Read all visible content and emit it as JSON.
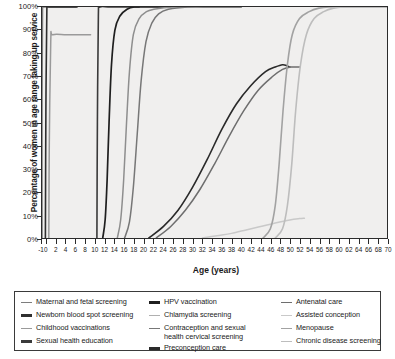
{
  "chart_data": {
    "type": "line",
    "title": "",
    "xlabel": "Age (years)",
    "ylabel": "Percentage of women in age range taking up service",
    "xlim": [
      -1,
      70
    ],
    "ylim": [
      0,
      100
    ],
    "grid": false,
    "legend_position": "below",
    "xticks": [
      -1,
      0,
      2,
      4,
      6,
      8,
      10,
      12,
      14,
      16,
      18,
      20,
      22,
      24,
      26,
      28,
      30,
      32,
      34,
      36,
      38,
      40,
      42,
      44,
      46,
      48,
      50,
      52,
      54,
      56,
      58,
      60,
      62,
      64,
      66,
      68,
      70
    ],
    "yticks": [
      0,
      10,
      20,
      30,
      40,
      50,
      60,
      70,
      80,
      90,
      100
    ],
    "ytick_labels": [
      "0%",
      "10%",
      "20%",
      "30%",
      "40%",
      "50%",
      "60%",
      "70%",
      "80%",
      "90%",
      "100%"
    ],
    "series": [
      {
        "name": "Maternal and fetal screening",
        "color": "#7d7d7d",
        "width": 1.6,
        "points": [
          [
            -1,
            0
          ],
          [
            -1,
            60
          ],
          [
            -0.9,
            99
          ],
          [
            -0.6,
            100
          ],
          [
            2,
            100
          ],
          [
            5,
            100
          ],
          [
            6,
            100
          ]
        ]
      },
      {
        "name": "Newborn blood spot screening",
        "color": "#2f2f2f",
        "width": 1.6,
        "points": [
          [
            -0.3,
            0
          ],
          [
            -0.2,
            55
          ],
          [
            0,
            99
          ],
          [
            0.4,
            100
          ],
          [
            3,
            100
          ],
          [
            6,
            100
          ],
          [
            6,
            100
          ]
        ]
      },
      {
        "name": "Childhood vaccinations",
        "color": "#9a9a9a",
        "width": 1.5,
        "points": [
          [
            0.4,
            0
          ],
          [
            0.5,
            40
          ],
          [
            0.8,
            85
          ],
          [
            1.2,
            88
          ],
          [
            4,
            88
          ],
          [
            7,
            88
          ],
          [
            9,
            88
          ]
        ]
      },
      {
        "name": "Sexual health education",
        "color": "#3a3a3a",
        "width": 1.6,
        "points": [
          [
            10.3,
            0
          ],
          [
            10.4,
            50
          ],
          [
            10.6,
            96
          ],
          [
            10.9,
            100
          ],
          [
            13,
            100
          ],
          [
            17,
            100
          ],
          [
            19,
            100
          ]
        ]
      },
      {
        "name": "HPV vaccination",
        "color": "#1f1f1f",
        "width": 1.7,
        "points": [
          [
            11.5,
            0
          ],
          [
            12,
            8
          ],
          [
            12.4,
            25
          ],
          [
            12.8,
            50
          ],
          [
            13.3,
            75
          ],
          [
            14,
            90
          ],
          [
            15,
            96
          ],
          [
            16.5,
            99
          ],
          [
            18,
            100
          ],
          [
            21,
            100
          ],
          [
            24,
            100
          ]
        ]
      },
      {
        "name": "Chlamydia screening",
        "color": "#8e8e8e",
        "width": 1.5,
        "points": [
          [
            14.5,
            0
          ],
          [
            15.2,
            8
          ],
          [
            15.8,
            25
          ],
          [
            16.4,
            50
          ],
          [
            17,
            72
          ],
          [
            17.8,
            88
          ],
          [
            19,
            95
          ],
          [
            20.5,
            98
          ],
          [
            22,
            99
          ],
          [
            26,
            100
          ],
          [
            30,
            100
          ],
          [
            36,
            100
          ],
          [
            40,
            100
          ]
        ]
      },
      {
        "name": "Contraception and sexual health cervical screening",
        "color": "#777777",
        "width": 1.5,
        "points": [
          [
            16,
            0
          ],
          [
            17,
            7
          ],
          [
            17.8,
            22
          ],
          [
            18.6,
            45
          ],
          [
            19.4,
            68
          ],
          [
            20.4,
            85
          ],
          [
            21.6,
            93
          ],
          [
            23,
            97
          ],
          [
            25,
            99
          ],
          [
            29,
            100
          ],
          [
            34,
            100
          ],
          [
            40,
            100
          ]
        ]
      },
      {
        "name": "Preconception care",
        "color": "#2a2a2a",
        "width": 1.6,
        "points": [
          [
            21,
            0
          ],
          [
            24,
            5
          ],
          [
            27,
            12
          ],
          [
            30,
            22
          ],
          [
            33,
            34
          ],
          [
            36,
            47
          ],
          [
            39,
            58
          ],
          [
            42,
            66
          ],
          [
            45,
            72
          ],
          [
            47,
            74
          ],
          [
            48.5,
            75
          ],
          [
            49.5,
            74.5
          ],
          [
            50,
            74
          ]
        ]
      },
      {
        "name": "Antenatal care",
        "color": "#6e6e6e",
        "width": 1.5,
        "points": [
          [
            22.5,
            0
          ],
          [
            25.5,
            5
          ],
          [
            28.5,
            12
          ],
          [
            31.5,
            21
          ],
          [
            34.5,
            32
          ],
          [
            37.5,
            44
          ],
          [
            40.5,
            55
          ],
          [
            43.5,
            64
          ],
          [
            46.5,
            70
          ],
          [
            48.5,
            73
          ],
          [
            50,
            74
          ],
          [
            51,
            74
          ],
          [
            52,
            74
          ]
        ]
      },
      {
        "name": "Assisted conception",
        "color": "#c9c9c9",
        "width": 1.5,
        "points": [
          [
            32,
            0
          ],
          [
            35,
            1
          ],
          [
            38,
            2
          ],
          [
            41,
            3.5
          ],
          [
            44,
            5
          ],
          [
            47,
            6.5
          ],
          [
            50,
            7.8
          ],
          [
            52,
            8.4
          ],
          [
            53,
            8.6
          ]
        ]
      },
      {
        "name": "Menopause",
        "color": "#a2a2a2",
        "width": 1.6,
        "points": [
          [
            44.5,
            0
          ],
          [
            46,
            4
          ],
          [
            47,
            14
          ],
          [
            47.8,
            32
          ],
          [
            48.6,
            55
          ],
          [
            49.5,
            75
          ],
          [
            50.5,
            88
          ],
          [
            52,
            95
          ],
          [
            54,
            98
          ],
          [
            56,
            99.5
          ],
          [
            58,
            100
          ],
          [
            62,
            100
          ],
          [
            66,
            100
          ],
          [
            70,
            100
          ]
        ]
      },
      {
        "name": "Chronic disease screening",
        "color": "#bdbdbd",
        "width": 1.6,
        "points": [
          [
            47,
            0
          ],
          [
            48.5,
            4
          ],
          [
            49.5,
            14
          ],
          [
            50.4,
            32
          ],
          [
            51.2,
            55
          ],
          [
            52.2,
            75
          ],
          [
            53.4,
            88
          ],
          [
            55,
            95
          ],
          [
            57,
            98
          ],
          [
            59,
            99.5
          ],
          [
            61,
            100
          ],
          [
            65,
            100
          ],
          [
            70,
            100
          ]
        ]
      }
    ]
  },
  "legend": {
    "columns": [
      {
        "items": [
          {
            "label": "Maternal and fetal screening",
            "color": "#7d7d7d",
            "weight": "normal"
          },
          {
            "label": "Newborn blood spot screening",
            "color": "#2f2f2f",
            "weight": "bold"
          },
          {
            "label": "Childhood vaccinations",
            "color": "#9a9a9a",
            "weight": "normal"
          },
          {
            "label": "Sexual health education",
            "color": "#3a3a3a",
            "weight": "bold"
          }
        ]
      },
      {
        "items": [
          {
            "label": "HPV vaccination",
            "color": "#1f1f1f",
            "weight": "bold"
          },
          {
            "label": "Chlamydia screening",
            "color": "#b0b0b0",
            "weight": "normal"
          },
          {
            "label": "Contraception and sexual\n    health cervical screening",
            "color": "#777777",
            "weight": "normal"
          },
          {
            "label": "Preconception care",
            "color": "#2a2a2a",
            "weight": "bold"
          }
        ]
      },
      {
        "items": [
          {
            "label": "Antenatal care",
            "color": "#6e6e6e",
            "weight": "normal"
          },
          {
            "label": "Assisted conception",
            "color": "#c9c9c9",
            "weight": "normal"
          },
          {
            "label": "Menopause",
            "color": "#a2a2a2",
            "weight": "normal"
          },
          {
            "label": "Chronic disease screening",
            "color": "#bdbdbd",
            "weight": "normal"
          }
        ]
      }
    ]
  }
}
